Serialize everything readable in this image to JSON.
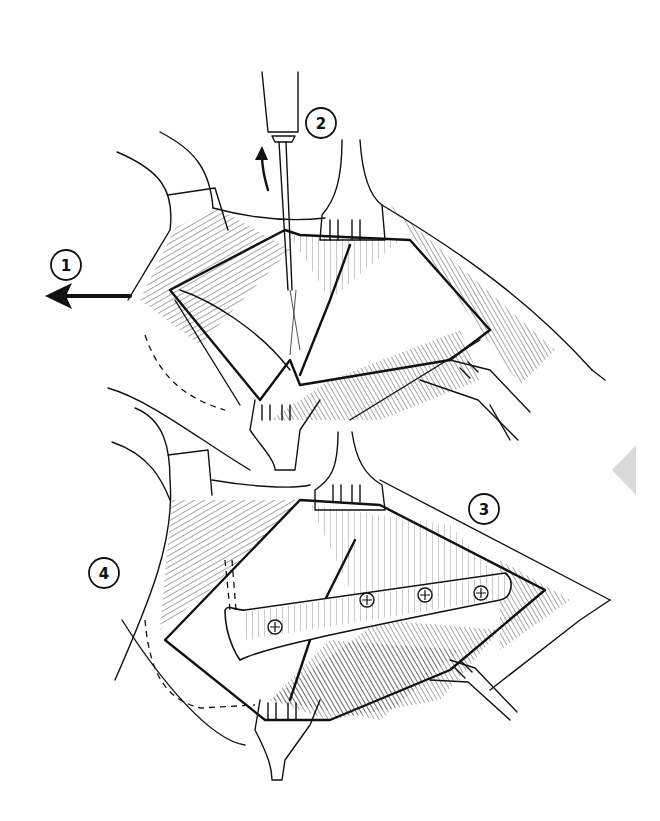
{
  "figure": {
    "type": "surgical-illustration",
    "panels": [
      {
        "id": "upper",
        "description": "Exposed fracture site held open by retractors; elevator lifting fragment"
      },
      {
        "id": "lower",
        "description": "Fracture reduced and fixed with a four-screw plate"
      }
    ],
    "labels": [
      {
        "id": "1",
        "text": "1",
        "x": 65,
        "y": 265,
        "note": "with leftward traction arrow"
      },
      {
        "id": "2",
        "text": "2",
        "x": 318,
        "y": 123,
        "note": "next to elevator instrument with upward curved arrow"
      },
      {
        "id": "3",
        "text": "3",
        "x": 483,
        "y": 508
      },
      {
        "id": "4",
        "text": "4",
        "x": 103,
        "y": 573
      }
    ],
    "plate": {
      "screw_count": 4
    },
    "colors": {
      "ink": "#111111",
      "paper": "#ffffff",
      "nav_arrow": "#d9d9d9"
    }
  },
  "nav": {
    "prev_icon": "triangle-left"
  }
}
